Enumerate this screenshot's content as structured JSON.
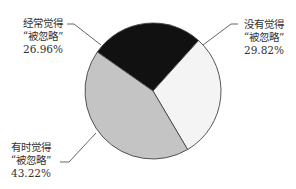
{
  "chart_data": {
    "type": "pie",
    "title": "",
    "center": [
      153,
      91
    ],
    "radius": 68,
    "start_angle_deg": 215,
    "slices": [
      {
        "label_line1": "经常觉得",
        "label_line2": "“被忽略”",
        "value": 26.96,
        "value_text": "26.96%",
        "color": "#111111"
      },
      {
        "label_line1": "没有觉得",
        "label_line2": "“被忽略”",
        "value": 29.82,
        "value_text": "29.82%",
        "color": "#f4f4f4"
      },
      {
        "label_line1": "有时觉得",
        "label_line2": "“被忽略”",
        "value": 43.22,
        "value_text": "43.22%",
        "color": "#c4c4c4"
      }
    ],
    "labels": [
      {
        "x": 43,
        "y": 17,
        "leader": [
          [
            67,
            24
          ],
          [
            74,
            24
          ],
          [
            101,
            45
          ]
        ]
      },
      {
        "x": 264,
        "y": 18,
        "leader": [
          [
            238,
            24
          ],
          [
            231,
            24
          ],
          [
            203,
            45
          ]
        ]
      },
      {
        "x": 31,
        "y": 141,
        "leader": [
          [
            60,
            162
          ],
          [
            69,
            162
          ],
          [
            96,
            133
          ]
        ]
      }
    ],
    "stroke_color": "#444444"
  }
}
